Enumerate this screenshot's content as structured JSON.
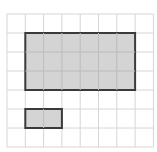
{
  "diagram": {
    "grid": {
      "cols": 8,
      "rows": 7,
      "origin_x": 7,
      "origin_y": 14,
      "cell_w": 18.3,
      "cell_h": 19,
      "line_color": "#d6d6d6"
    },
    "shapes": [
      {
        "name": "large-rectangle",
        "col": 1,
        "row": 1,
        "width_cells": 6,
        "height_cells": 3,
        "fill": "#cfcfcf",
        "stroke": "#3a3a3a"
      },
      {
        "name": "small-rectangle",
        "col": 1,
        "row": 5,
        "width_cells": 2,
        "height_cells": 1,
        "fill": "#cfcfcf",
        "stroke": "#3a3a3a"
      }
    ]
  }
}
